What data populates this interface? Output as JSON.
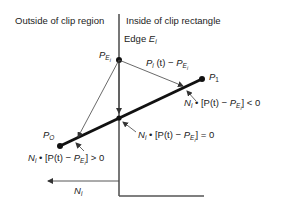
{
  "diagram": {
    "region_labels": {
      "outside": "Outside of clip region",
      "inside": "Inside of clip rectangle"
    },
    "edge_label": {
      "prefix": "Edge ",
      "symbol": "E",
      "subscript": "i"
    },
    "points": {
      "p_ei": {
        "symbol": "P",
        "subscript": "E",
        "subsub": "i"
      },
      "p1": {
        "symbol": "P",
        "subscript": "1"
      },
      "p0": {
        "symbol": "P",
        "subscript": "O"
      }
    },
    "vector_label": {
      "lhs": "P",
      "lhs_sub": "i",
      "mid": " (t) − ",
      "rhs": "P",
      "rhs_sub": "E",
      "rhs_subsub": "i"
    },
    "conditions": {
      "less": {
        "n": "N",
        "n_sub": "i",
        "body": " • [P(t) − ",
        "p": "P",
        "p_sub": "E",
        "p_subsub": "i",
        "tail": "] < 0"
      },
      "equal": {
        "n": "N",
        "n_sub": "i",
        "body": " • [P(t) − ",
        "p": "P",
        "p_sub": "E",
        "p_subsub": "i",
        "tail": "] = 0"
      },
      "greater": {
        "n": "N",
        "n_sub": "i",
        "body": " • [P(t) − ",
        "p": "P",
        "p_sub": "E",
        "p_subsub": "i",
        "tail": "] > 0"
      }
    },
    "normal_label": {
      "symbol": "N",
      "subscript": "i"
    },
    "colors": {
      "line": "#111111",
      "edge": "#555555",
      "arrow": "#444444"
    }
  }
}
